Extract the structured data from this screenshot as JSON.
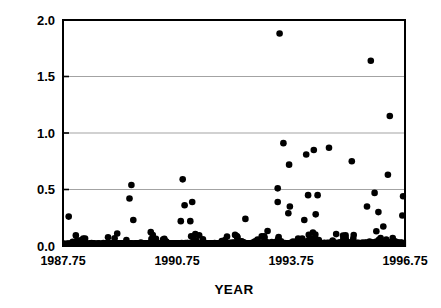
{
  "chart_data": {
    "type": "scatter",
    "title": "",
    "xlabel": "YEAR",
    "ylabel": "FLOW (M3/SEC-M2)",
    "ylabel_parts": {
      "prefix": "FLOW (M",
      "sup1": "3",
      "mid": "/SEC-M",
      "sup2": "2",
      "suffix": ")"
    },
    "xlim": [
      1987.75,
      1996.75
    ],
    "ylim": [
      0.0,
      2.0
    ],
    "xticks": [
      1987.75,
      1990.75,
      1993.75,
      1996.75
    ],
    "xtick_labels": [
      "1987.75",
      "1990.75",
      "1993.75",
      "1996.75"
    ],
    "yticks": [
      0.0,
      0.5,
      1.0,
      1.5,
      2.0
    ],
    "ytick_labels": [
      "0.0",
      "0.5",
      "1.0",
      "1.5",
      "2.0"
    ],
    "grid": "horizontal",
    "grid_color": "#999999",
    "marker": "filled-circle",
    "marker_color": "#000000",
    "marker_size": 4.6,
    "frame": true,
    "frame_color": "#000000",
    "legend": "none",
    "series": [
      {
        "name": "Daily flow",
        "notable_points": [
          {
            "x": 1993.45,
            "y": 1.88
          },
          {
            "x": 1995.85,
            "y": 1.64
          },
          {
            "x": 1996.35,
            "y": 1.15
          },
          {
            "x": 1993.55,
            "y": 0.91
          },
          {
            "x": 1994.75,
            "y": 0.87
          },
          {
            "x": 1994.35,
            "y": 0.85
          },
          {
            "x": 1994.15,
            "y": 0.81
          },
          {
            "x": 1995.35,
            "y": 0.75
          },
          {
            "x": 1993.7,
            "y": 0.72
          },
          {
            "x": 1996.3,
            "y": 0.63
          },
          {
            "x": 1990.9,
            "y": 0.59
          },
          {
            "x": 1989.55,
            "y": 0.54
          },
          {
            "x": 1993.4,
            "y": 0.51
          },
          {
            "x": 1995.95,
            "y": 0.47
          },
          {
            "x": 1994.2,
            "y": 0.45
          },
          {
            "x": 1994.45,
            "y": 0.45
          },
          {
            "x": 1996.7,
            "y": 0.44
          },
          {
            "x": 1989.5,
            "y": 0.42
          },
          {
            "x": 1991.15,
            "y": 0.39
          },
          {
            "x": 1993.4,
            "y": 0.39
          },
          {
            "x": 1990.95,
            "y": 0.36
          },
          {
            "x": 1993.72,
            "y": 0.35
          },
          {
            "x": 1995.75,
            "y": 0.35
          },
          {
            "x": 1996.05,
            "y": 0.3
          },
          {
            "x": 1993.68,
            "y": 0.29
          },
          {
            "x": 1994.4,
            "y": 0.28
          },
          {
            "x": 1996.68,
            "y": 0.27
          },
          {
            "x": 1987.9,
            "y": 0.26
          },
          {
            "x": 1992.55,
            "y": 0.24
          },
          {
            "x": 1989.6,
            "y": 0.23
          },
          {
            "x": 1994.1,
            "y": 0.23
          },
          {
            "x": 1991.1,
            "y": 0.22
          },
          {
            "x": 1990.85,
            "y": 0.22
          }
        ],
        "description": "Dense near-continuous daily record along baseline 0.0-0.15 spanning full record, with episodic storm peaks.",
        "baseline_range": [
          0.0,
          0.16
        ],
        "n_points_approx": 3280
      }
    ]
  },
  "axes": {
    "plot_left_px": 63,
    "plot_right_px": 405,
    "plot_top_px": 20,
    "plot_bottom_px": 246
  }
}
